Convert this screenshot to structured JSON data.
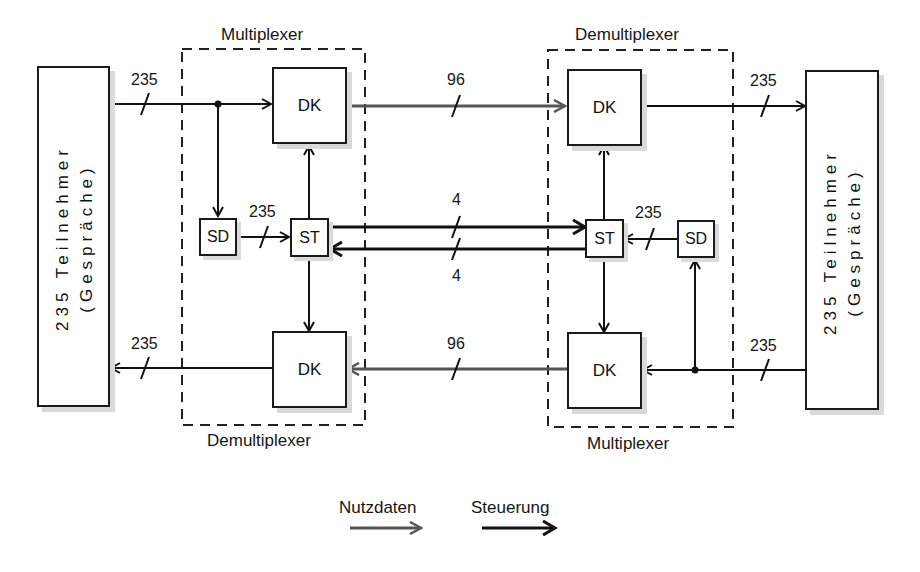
{
  "diagram": {
    "left_group": {
      "top_label": "Multiplexer",
      "bottom_label": "Demultiplexer"
    },
    "right_group": {
      "top_label": "Demultiplexer",
      "bottom_label": "Multiplexer"
    },
    "subscribers_left": {
      "line1": "235 Teilnehmer",
      "line2": "(Gespräche)"
    },
    "subscribers_right": {
      "line1": "235 Teilnehmer",
      "line2": "(Gespräche)"
    },
    "blocks": {
      "dk": "DK",
      "st": "ST",
      "sd": "SD"
    },
    "line_counts": {
      "left_in": "235",
      "left_sd_st": "235",
      "left_out": "235",
      "top_trunk": "96",
      "bottom_trunk": "96",
      "control_forward": "4",
      "control_back": "4",
      "right_out": "235",
      "right_sd_st": "235",
      "right_in": "235"
    },
    "legend": {
      "user_data": "Nutzdaten",
      "control": "Steuerung"
    },
    "colors": {
      "user_data_line": "#555555",
      "control_line": "#111111"
    }
  }
}
